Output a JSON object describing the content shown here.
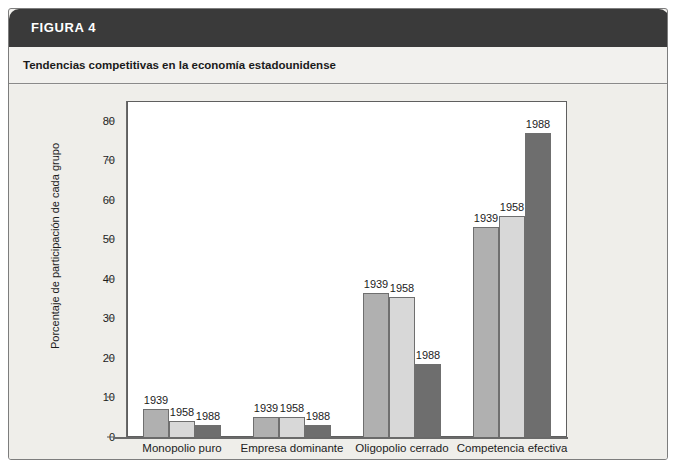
{
  "figure": {
    "header_label": "FIGURA 4",
    "subtitle": "Tendencias competitivas en la economía estadounidense"
  },
  "colors": {
    "header_band": "#3a3a3a",
    "panel": "#f2f1ee",
    "plot_background": "#ffffff",
    "series_1939": "#b0b0b0",
    "series_1958": "#d8d8d8",
    "series_1988": "#6e6e6e",
    "axis": "#6a6a6a",
    "text": "#1c1c1c"
  },
  "chart_data": {
    "type": "bar",
    "title": "Tendencias competitivas en la economía estadounidense",
    "xlabel": "",
    "ylabel": "Porcentaje de participación de cada grupo",
    "ylim": [
      0,
      85
    ],
    "yticks": [
      0,
      10,
      20,
      30,
      40,
      50,
      60,
      70,
      80
    ],
    "ytick_labels": [
      "0",
      "10",
      "20",
      "30",
      "40",
      "50",
      "60",
      "70",
      "80"
    ],
    "grid": false,
    "legend": "none",
    "data_labels": true,
    "categories": [
      "Monopolio puro",
      "Empresa dominante",
      "Oligopolio cerrado",
      "Competencia efectiva"
    ],
    "series": [
      {
        "name": "1939",
        "color": "#b0b0b0",
        "values": [
          7,
          5,
          36.5,
          53
        ]
      },
      {
        "name": "1958",
        "color": "#d8d8d8",
        "values": [
          4,
          5,
          35.5,
          56
        ]
      },
      {
        "name": "1988",
        "color": "#6e6e6e",
        "values": [
          3,
          3,
          18.5,
          77
        ]
      }
    ]
  }
}
